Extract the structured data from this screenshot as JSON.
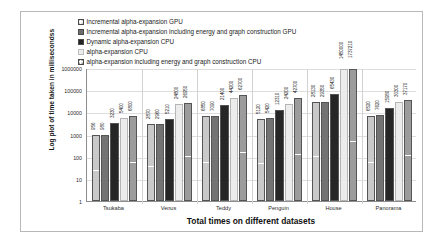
{
  "chart_data": {
    "type": "bar",
    "title": "",
    "xlabel": "Total times on different datasets",
    "ylabel": "Log plot of time taken in millisecondss",
    "yscale": "log",
    "ylim": [
      1,
      1000000
    ],
    "ytick_labels": [
      "1000000",
      "100000",
      "10000",
      "1000",
      "100",
      "10",
      "1"
    ],
    "grid": true,
    "legend_position": "top",
    "categories": [
      "Tsukaba",
      "Venus",
      "Teddy",
      "Penguin",
      "House",
      "Panorama"
    ],
    "series": [
      {
        "name": "Incremental alpha-expansion GPU",
        "swatch": "s0",
        "values": [
          956,
          2870,
          6850,
          5120,
          28130,
          6520
        ],
        "labels": [
          "956",
          "2870",
          "6850",
          "5120",
          "28130",
          "6520"
        ]
      },
      {
        "name": "Incremental alpha-expansion including energy and graph construction GPU",
        "swatch": "s1",
        "values": [
          980,
          2960,
          7090,
          5420,
          29350,
          7620
        ],
        "labels": [
          "980",
          "2960",
          "7090",
          "5420",
          "29350",
          "7620"
        ]
      },
      {
        "name": "Dynamic alpha-expansion CPU",
        "swatch": "s2",
        "values": [
          3230,
          5210,
          21400,
          12310,
          65430,
          15980
        ],
        "labels": [
          "3230",
          "5210",
          "21400",
          "12310",
          "65430",
          "15980"
        ]
      },
      {
        "name": "alpha-expansion CPU",
        "swatch": "s3",
        "values": [
          5400,
          24800,
          44200,
          24200,
          1450000,
          30300
        ],
        "labels": [
          "5400",
          "24800",
          "44200",
          "24200",
          "1450000",
          "30300"
        ]
      },
      {
        "name": "alpha-expansion including energy and graph construction CPU",
        "swatch": "s4",
        "values": [
          6800,
          26950,
          62700,
          42700,
          1737210,
          37170
        ],
        "labels": [
          "6800",
          "26950",
          "62700",
          "42700",
          "1737210",
          "37170"
        ]
      }
    ]
  }
}
